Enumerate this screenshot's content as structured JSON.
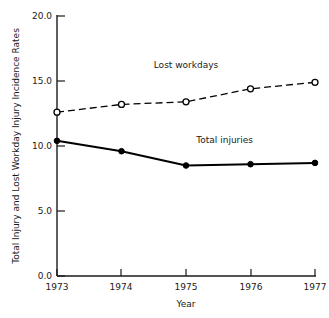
{
  "chart_data": {
    "type": "line",
    "title": "",
    "xlabel": "Year",
    "ylabel": "Total Injury and Lost Workday Injury Incidence Rates",
    "categories": [
      "1973",
      "1974",
      "1975",
      "1976",
      "1977"
    ],
    "x": [
      1973,
      1974,
      1975,
      1976,
      1977
    ],
    "xlim": [
      1973,
      1977
    ],
    "ylim": [
      0.0,
      20.0
    ],
    "yticks": [
      "0.0",
      "5.0",
      "10.0",
      "15.0",
      "20.0"
    ],
    "ytick_values": [
      0.0,
      5.0,
      10.0,
      15.0,
      20.0
    ],
    "xticks": [
      "1973",
      "1974",
      "1975",
      "1976",
      "1977"
    ],
    "grid": false,
    "legend": "inline-annotations",
    "series": [
      {
        "name": "Lost workdays",
        "values": [
          12.6,
          13.2,
          13.4,
          14.4,
          14.9
        ],
        "style": "dashed",
        "marker": "open-circle",
        "color": "#000000",
        "label_x": 1975.0,
        "label_y": 16.0
      },
      {
        "name": "Total injuries",
        "values": [
          10.4,
          9.6,
          8.5,
          8.6,
          8.7
        ],
        "style": "solid",
        "marker": "filled-circle",
        "color": "#000000",
        "label_x": 1975.6,
        "label_y": 10.2
      }
    ],
    "annotations": [
      {
        "text": "Lost workdays",
        "x": 1975.0,
        "y": 16.0
      },
      {
        "text": "Total injuries",
        "x": 1975.6,
        "y": 10.2
      }
    ]
  }
}
